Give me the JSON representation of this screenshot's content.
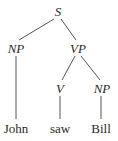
{
  "tree": {
    "nodes": {
      "s": {
        "label": "S",
        "x": 58,
        "y": 5
      },
      "np1": {
        "label": "NP",
        "x": 16,
        "y": 41
      },
      "vp": {
        "label": "VP",
        "x": 78,
        "y": 41
      },
      "v": {
        "label": "V",
        "x": 60,
        "y": 81
      },
      "np2": {
        "label": "NP",
        "x": 102,
        "y": 81
      },
      "john": {
        "label": "John",
        "x": 16,
        "y": 122
      },
      "saw": {
        "label": "saw",
        "x": 60,
        "y": 122
      },
      "bill": {
        "label": "Bill",
        "x": 101,
        "y": 122
      }
    },
    "line_color": "#555555"
  }
}
